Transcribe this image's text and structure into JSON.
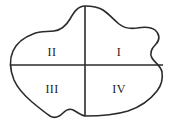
{
  "figure": {
    "type": "region-diagram",
    "canvas": {
      "width": 176,
      "height": 137
    },
    "background_color": "#ffffff",
    "outline": {
      "name": "blob-outline",
      "stroke_color": "#2b2b2b",
      "stroke_width": 1.6,
      "fill_color": "#ffffff",
      "shape": "amoeba"
    },
    "dividers": [
      {
        "name": "vertical-divider",
        "orientation": "vertical",
        "x": 85,
        "y_start": 6,
        "y_end": 116,
        "stroke_color": "#2b2b2b",
        "stroke_width": 1.6
      },
      {
        "name": "horizontal-divider",
        "orientation": "horizontal",
        "y": 65,
        "x_start": 11,
        "x_end": 163,
        "stroke_color": "#2b2b2b",
        "stroke_width": 1.6
      }
    ],
    "labels": [
      {
        "id": "quadrant-1",
        "text": "I",
        "x": 119,
        "y": 52,
        "position": "top-right"
      },
      {
        "id": "quadrant-2",
        "text": "II",
        "x": 52,
        "y": 52,
        "position": "top-left"
      },
      {
        "id": "quadrant-3",
        "text": "III",
        "x": 52,
        "y": 89,
        "position": "bottom-left"
      },
      {
        "id": "quadrant-4",
        "text": "IV",
        "x": 119,
        "y": 89,
        "position": "bottom-right"
      }
    ]
  }
}
